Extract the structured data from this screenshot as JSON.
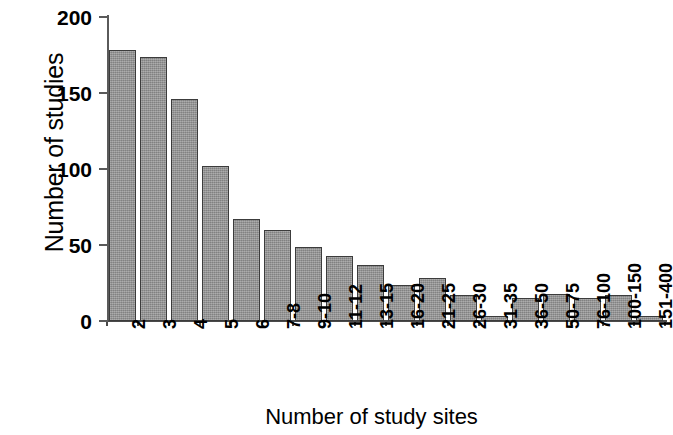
{
  "chart_data": {
    "type": "bar",
    "title": "",
    "xlabel": "Number of study sites",
    "ylabel": "Number of studies",
    "categories": [
      "2",
      "3",
      "4",
      "5",
      "6",
      "7-8",
      "9-10",
      "11-12",
      "13-15",
      "16-20",
      "21-25",
      "26-30",
      "31-35",
      "36-50",
      "50-75",
      "76-100",
      "100-150",
      "151-400"
    ],
    "values": [
      178,
      174,
      146,
      102,
      67,
      60,
      49,
      43,
      37,
      24,
      28,
      17,
      3,
      15,
      18,
      15,
      17,
      3
    ],
    "ylim": [
      0,
      200
    ],
    "yticks": [
      0,
      50,
      100,
      150,
      200
    ],
    "ytick_labels": [
      "0",
      "50",
      "100",
      "150",
      "200"
    ],
    "grid": false,
    "legend": false,
    "bar_color": "#8e8e8e",
    "bar_edge_color": "#3c3c3c",
    "axis_color": "#4a4a4a"
  }
}
